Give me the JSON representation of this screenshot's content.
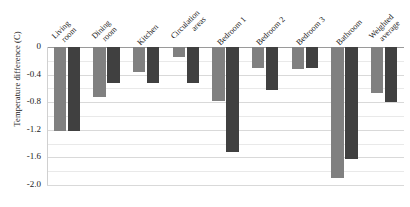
{
  "chart_data": {
    "type": "bar",
    "title": "",
    "subtitle": "",
    "xlabel": "",
    "ylabel": "Temperature difference (C)",
    "ylim": [
      -2.0,
      0.0
    ],
    "yticks": [
      "0",
      "-0.4",
      "-0.8",
      "-1.2",
      "-1.6",
      "-2.0"
    ],
    "ytick_values": [
      0,
      -0.4,
      -0.8,
      -1.2,
      -1.6,
      -2.0
    ],
    "grid": true,
    "minor_grid": true,
    "minor_grid_step": 0.2,
    "legend": "none",
    "orientation": "vertical",
    "categories": [
      "Living room",
      "Dining room",
      "Kitchen",
      "Circulation areas",
      "Bedroom 1",
      "Bedroom 2",
      "Bedroom 3",
      "Bathroom",
      "Weighted average"
    ],
    "category_lines": [
      [
        "Living",
        "room"
      ],
      [
        "Dining",
        "room"
      ],
      [
        "Kitchen",
        ""
      ],
      [
        "Circulation",
        "areas"
      ],
      [
        "Bedroom 1",
        ""
      ],
      [
        "Bedroom 2",
        ""
      ],
      [
        "Bedroom 3",
        ""
      ],
      [
        "Bathroom",
        ""
      ],
      [
        "Weighted",
        "average"
      ]
    ],
    "series": [
      {
        "name": "series-1",
        "color": "#808080",
        "values": [
          -1.22,
          -0.72,
          -0.36,
          -0.14,
          -0.78,
          -0.3,
          -0.32,
          -1.9,
          -0.66
        ]
      },
      {
        "name": "series-2",
        "color": "#404040",
        "values": [
          -1.22,
          -0.52,
          -0.52,
          -0.52,
          -1.52,
          -0.62,
          -0.3,
          -1.62,
          -0.8
        ]
      }
    ]
  },
  "colors": {
    "series_1": "#808080",
    "series_2": "#404040",
    "gridline": "#d9d9d9",
    "minor_gridline": "#e9e9e9",
    "zero_line": "#9a9a9a",
    "background": "#ffffff",
    "text": "#1a1a1a"
  }
}
